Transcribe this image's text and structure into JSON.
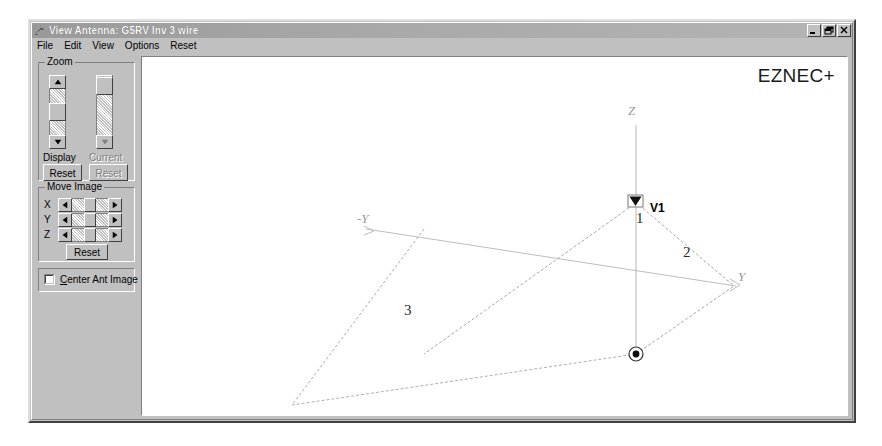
{
  "window": {
    "title": "View Antenna: G5RV Inv 3 wire",
    "icon": "antenna-icon",
    "buttons": [
      {
        "name": "minimize",
        "glyph": "_"
      },
      {
        "name": "restore",
        "glyph": "❐"
      },
      {
        "name": "close",
        "glyph": "✕"
      }
    ]
  },
  "menu": {
    "items": [
      {
        "label": "File"
      },
      {
        "label": "Edit"
      },
      {
        "label": "View"
      },
      {
        "label": "Options"
      },
      {
        "label": "Reset"
      }
    ]
  },
  "zoom_group": {
    "title": "Zoom",
    "display": {
      "label": "Display",
      "reset_label": "Reset",
      "enabled": true,
      "thumb_position_pct": 50
    },
    "current": {
      "label": "Current",
      "reset_label": "Reset",
      "enabled": false,
      "thumb_position_pct": 8
    }
  },
  "move_group": {
    "title": "Move Image",
    "axes": [
      {
        "label": "X"
      },
      {
        "label": "Y"
      },
      {
        "label": "Z"
      }
    ],
    "reset_label": "Reset"
  },
  "center_group": {
    "checkbox_label_prefix": "",
    "checkbox_accel": "C",
    "checkbox_label_rest": "enter Ant Image",
    "checked": false
  },
  "canvas": {
    "logo": "EZNEC+",
    "background": "#ffffff",
    "axis_color": "#b0b0b0",
    "wire_color": "#9a9a9a",
    "axis_labels": [
      {
        "name": "z-axis-label",
        "text": "Z",
        "x": 489,
        "y": 58
      },
      {
        "name": "neg-y-axis-label",
        "text": "-Y",
        "x": 222,
        "y": 166
      },
      {
        "name": "y-axis-label",
        "text": "Y",
        "x": 597,
        "y": 225
      }
    ],
    "source": {
      "label": "V1",
      "marker": "voltage-source-marker",
      "x": 364,
      "y": 138
    },
    "wires": [
      {
        "id": "1",
        "label": "1",
        "label_x": 367,
        "label_y": 160
      },
      {
        "id": "2",
        "label": "2",
        "label_x": 478,
        "label_y": 196
      },
      {
        "id": "3",
        "label": "3",
        "label_x": 265,
        "label_y": 253
      }
    ],
    "origin_marker": "coordinate-origin-marker"
  }
}
